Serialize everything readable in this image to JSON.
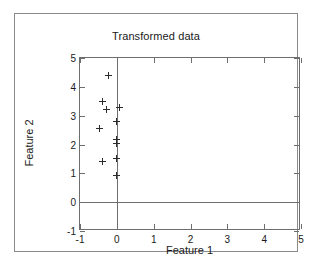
{
  "figure": {
    "title": "Transformed data",
    "frame_color": "#8a8a8a",
    "axis_color": "#6e6e6e",
    "marker_color": "#2b2b2b"
  },
  "chart_data": {
    "type": "scatter",
    "title": "Transformed data",
    "xlabel": "Feature 1",
    "ylabel": "Feature 2",
    "xlim": [
      -1,
      5
    ],
    "ylim": [
      -1,
      5
    ],
    "xticks": [
      -1,
      0,
      1,
      2,
      3,
      4,
      5
    ],
    "xticklabels": [
      "-1",
      "0",
      "1",
      "2",
      "3",
      "4",
      "5"
    ],
    "yticks": [
      -1,
      0,
      1,
      2,
      3,
      4,
      5
    ],
    "yticklabels": [
      "-1",
      "0",
      "1",
      "2",
      "3",
      "4",
      "5"
    ],
    "grid": false,
    "legend": null,
    "marker": "+",
    "series": [
      {
        "name": "transformed points",
        "points": [
          {
            "x": -0.22,
            "y": 4.4
          },
          {
            "x": -0.38,
            "y": 3.48
          },
          {
            "x": -0.28,
            "y": 3.22
          },
          {
            "x": 0.07,
            "y": 3.3
          },
          {
            "x": 0.0,
            "y": 2.8
          },
          {
            "x": -0.48,
            "y": 2.55
          },
          {
            "x": 0.0,
            "y": 2.17
          },
          {
            "x": 0.0,
            "y": 2.05
          },
          {
            "x": 0.0,
            "y": 1.5
          },
          {
            "x": -0.4,
            "y": 1.4
          },
          {
            "x": 0.0,
            "y": 0.93
          }
        ]
      }
    ],
    "annotations": [
      {
        "kind": "vline",
        "x": 0
      },
      {
        "kind": "hline",
        "y": 0
      }
    ]
  }
}
